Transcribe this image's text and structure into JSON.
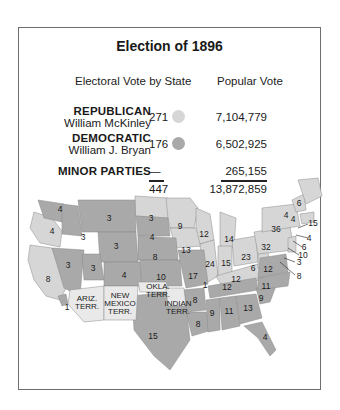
{
  "title": "Election of 1896",
  "headers": {
    "electoral": "Electoral Vote by State",
    "popular": "Popular Vote"
  },
  "colors": {
    "republican": "#d6d6d6",
    "democratic": "#a9a9a9",
    "territory": "#e9e9e9",
    "frame": "#6e6e6e"
  },
  "parties": [
    {
      "party": "REPUBLICAN",
      "candidate": "William McKinley",
      "electoral": "271",
      "popular": "7,104,779"
    },
    {
      "party": "DEMOCRATIC",
      "candidate": "William J. Bryan",
      "electoral": "176",
      "popular": "6,502,925"
    },
    {
      "party": "MINOR PARTIES",
      "candidate": "",
      "electoral": "—",
      "popular": "265,155"
    }
  ],
  "totals": {
    "electoral": "447",
    "popular": "13,872,859"
  },
  "map": {
    "territories": [
      "ARIZ. TERR.",
      "NEW MEXICO TERR.",
      "OKLA. TERR.",
      "INDIAN TERR."
    ],
    "state_votes": {
      "WA": "4",
      "OR": "4",
      "CA": "8",
      "NV": "3",
      "ID": "3",
      "MT": "3",
      "WY": "3",
      "UT": "3",
      "CO": "4",
      "ND": "3",
      "SD": "4",
      "NE": "8",
      "KS": "10",
      "TX": "15",
      "MN": "9",
      "IA": "13",
      "MO": "17",
      "AR": "8",
      "LA": "8",
      "WI": "12",
      "IL": "24",
      "MI": "14",
      "IN": "15",
      "OH": "23",
      "KY": "12",
      "TN": "12",
      "MS": "9",
      "AL": "11",
      "GA": "13",
      "FL": "4",
      "SC": "9",
      "NC": "11",
      "VA": "12",
      "WV": "6",
      "PA": "32",
      "NY": "36",
      "VT": "4",
      "NH": "4",
      "ME": "6",
      "MA": "15",
      "RI": "4",
      "CT": "6",
      "NJ": "10",
      "DE": "3",
      "MD": "8",
      "KY_split": "1",
      "CA_split": "1"
    }
  }
}
